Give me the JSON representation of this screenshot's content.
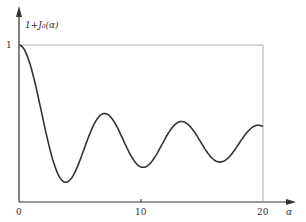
{
  "chart_data": {
    "type": "line",
    "title": "",
    "xlabel": "α",
    "ylabel": "1+J₀(α)",
    "xticks": [
      "0",
      "10",
      "20"
    ],
    "yticks": [
      "1"
    ],
    "xlim": [
      0,
      20
    ],
    "series": [
      {
        "name": "1+J0(α) (normalized)",
        "x": [
          0,
          2,
          3.83,
          5,
          7.02,
          8.65,
          10.17,
          11.8,
          13.32,
          15,
          16.47,
          18,
          19.62,
          20
        ],
        "values": [
          1.0,
          0.61,
          0.3,
          0.41,
          0.65,
          0.58,
          0.375,
          0.55,
          0.61,
          0.52,
          0.4,
          0.53,
          0.59,
          0.58
        ]
      }
    ],
    "grid": false,
    "legend": "none"
  },
  "labels": {
    "ylabel": "1+J₀(α)",
    "y1": "1",
    "x0": "0",
    "x10": "10",
    "x20": "20",
    "xlabel": "α"
  }
}
